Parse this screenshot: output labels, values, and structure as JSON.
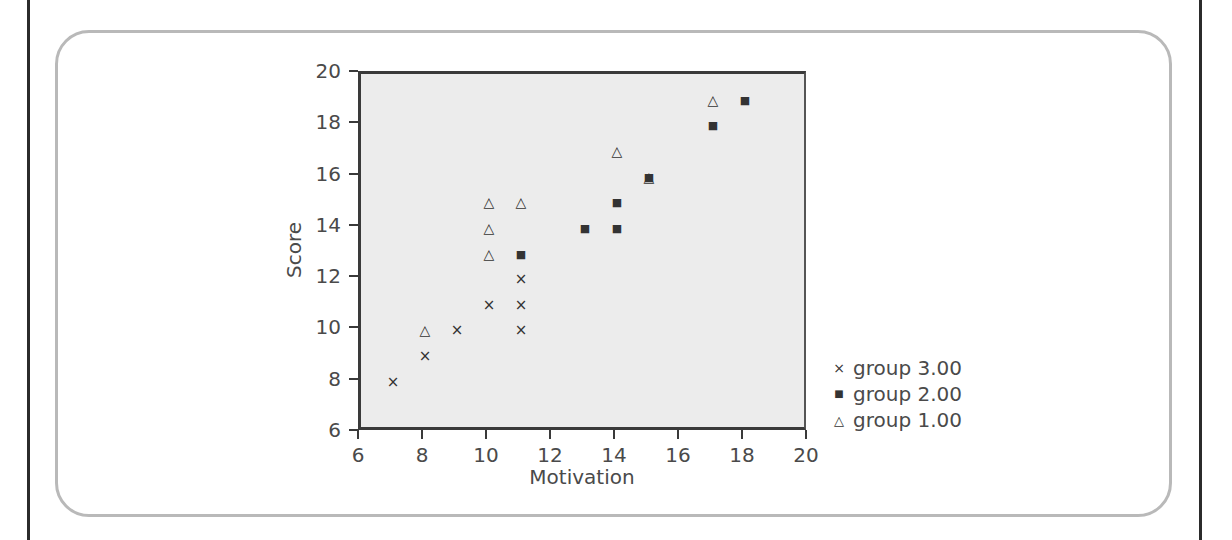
{
  "colors": {
    "page_background": "#ffffff",
    "page_rule": "#2b2b2b",
    "panel_border": "#b9b9b9",
    "plot_background": "#ececec",
    "axis": "#3a3a3a",
    "text": "#4a4a4a",
    "marker": "#333333"
  },
  "axis_titles": {
    "x": "Motivation",
    "y": "Score"
  },
  "x_ticks": [
    "6",
    "8",
    "10",
    "12",
    "14",
    "16",
    "18",
    "20"
  ],
  "y_ticks": [
    "6",
    "8",
    "10",
    "12",
    "14",
    "16",
    "18",
    "20"
  ],
  "legend": {
    "items": [
      {
        "marker": "cross-marker",
        "glyph": "×",
        "label": "group 3.00"
      },
      {
        "marker": "square-marker",
        "glyph": "■",
        "label": "group 2.00"
      },
      {
        "marker": "triangle-marker",
        "glyph": "△",
        "label": "group 1.00"
      }
    ]
  },
  "chart_data": {
    "type": "scatter",
    "title": "",
    "xlabel": "Motivation",
    "ylabel": "Score",
    "xlim": [
      6,
      20
    ],
    "ylim": [
      6,
      20
    ],
    "xticks": [
      6,
      8,
      10,
      12,
      14,
      16,
      18,
      20
    ],
    "yticks": [
      6,
      8,
      10,
      12,
      14,
      16,
      18,
      20
    ],
    "grid": false,
    "legend_position": "right",
    "series": [
      {
        "name": "group 3.00",
        "marker": "cross",
        "glyph": "×",
        "points": [
          [
            7,
            8
          ],
          [
            8,
            9
          ],
          [
            9,
            10
          ],
          [
            10,
            11
          ],
          [
            11,
            12
          ],
          [
            11,
            11
          ],
          [
            11,
            10
          ]
        ]
      },
      {
        "name": "group 2.00",
        "marker": "square",
        "glyph": "■",
        "points": [
          [
            11,
            13
          ],
          [
            13,
            14
          ],
          [
            14,
            14
          ],
          [
            14,
            15
          ],
          [
            15,
            16
          ],
          [
            17,
            18
          ],
          [
            18,
            19
          ]
        ]
      },
      {
        "name": "group 1.00",
        "marker": "triangle",
        "glyph": "△",
        "points": [
          [
            8,
            10
          ],
          [
            10,
            13
          ],
          [
            10,
            14
          ],
          [
            10,
            15
          ],
          [
            11,
            15
          ],
          [
            14,
            17
          ],
          [
            15,
            16
          ],
          [
            17,
            19
          ]
        ]
      }
    ]
  }
}
